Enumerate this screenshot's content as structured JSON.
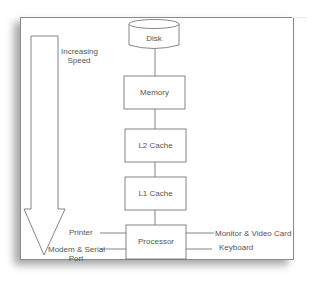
{
  "diagram": {
    "speed_arrow": {
      "label_line1": "Increasing",
      "label_line2": "Speed",
      "direction": "down"
    },
    "nodes": [
      {
        "id": "disk",
        "label": "Disk",
        "shape": "cylinder"
      },
      {
        "id": "memory",
        "label": "Memory",
        "shape": "rectangle"
      },
      {
        "id": "l2",
        "label": "L2 Cache",
        "shape": "rectangle"
      },
      {
        "id": "l1",
        "label": "L1 Cache",
        "shape": "rectangle"
      },
      {
        "id": "processor",
        "label": "Processor",
        "shape": "rectangle"
      }
    ],
    "edges": [
      {
        "from": "disk",
        "to": "memory"
      },
      {
        "from": "memory",
        "to": "l2"
      },
      {
        "from": "l2",
        "to": "l1"
      },
      {
        "from": "l1",
        "to": "processor"
      }
    ],
    "peripherals": {
      "left": [
        {
          "label": "Printer"
        },
        {
          "label_line1": "Modem & Serial",
          "label_line2": "Port"
        }
      ],
      "right": [
        {
          "label": "Monitor & Video Card"
        },
        {
          "label": "Keyboard"
        }
      ]
    },
    "colors": {
      "stroke": "#666666",
      "text": "#555555",
      "background": "#ffffff"
    }
  }
}
